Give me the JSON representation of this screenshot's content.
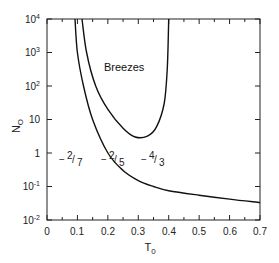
{
  "chart_data": {
    "type": "line",
    "title": "",
    "xlabel": "T0",
    "ylabel": "N0",
    "xlim": [
      0,
      0.7
    ],
    "ylim": [
      0.01,
      10000
    ],
    "yscale": "log",
    "grid": false,
    "legend": null,
    "x_ticks": [
      "0",
      "0.1",
      "0.2",
      "0.3",
      "0.4",
      "0.5",
      "0.6",
      "0.7"
    ],
    "y_ticks": [
      "10^-2",
      "10^-1",
      "1",
      "10",
      "10^2",
      "10^3",
      "10^4"
    ],
    "region_label": "Breezes",
    "annotations": [
      "-2/7",
      "-2/5",
      "-4/3"
    ],
    "series": [
      {
        "name": "lower boundary",
        "points": [
          [
            0.092,
            10000
          ],
          [
            0.1,
            1000
          ],
          [
            0.12,
            100
          ],
          [
            0.15,
            10
          ],
          [
            0.2,
            1
          ],
          [
            0.25,
            0.3
          ],
          [
            0.3,
            0.15
          ],
          [
            0.35,
            0.1
          ],
          [
            0.4,
            0.075
          ],
          [
            0.5,
            0.055
          ],
          [
            0.6,
            0.042
          ],
          [
            0.7,
            0.033
          ]
        ]
      },
      {
        "name": "breeze boundary (U-shaped)",
        "points": [
          [
            0.115,
            10000
          ],
          [
            0.13,
            1000
          ],
          [
            0.16,
            100
          ],
          [
            0.2,
            20
          ],
          [
            0.25,
            5.5
          ],
          [
            0.29,
            3
          ],
          [
            0.33,
            3.2
          ],
          [
            0.36,
            6
          ],
          [
            0.385,
            30
          ],
          [
            0.395,
            300
          ],
          [
            0.4,
            10000
          ]
        ]
      }
    ]
  },
  "labels": {
    "y_axis_title": "N",
    "y_axis_sub": "O",
    "x_axis_title": "T",
    "x_axis_sub": "0",
    "region": "Breezes",
    "annot1_num": "2",
    "annot1_den": "7",
    "annot2_num": "2",
    "annot2_den": "5",
    "annot3_num": "4",
    "annot3_den": "3"
  },
  "ticks": {
    "x": [
      "0",
      "0.1",
      "0.2",
      "0.3",
      "0.4",
      "0.5",
      "0.6",
      "0.7"
    ],
    "y": [
      {
        "base": "10",
        "exp": "4"
      },
      {
        "base": "10",
        "exp": "3"
      },
      {
        "base": "10",
        "exp": "2"
      },
      {
        "base": "10",
        "exp": ""
      },
      {
        "base": "1",
        "exp": ""
      },
      {
        "base": "10",
        "exp": "-1"
      },
      {
        "base": "10",
        "exp": "-2"
      }
    ]
  }
}
